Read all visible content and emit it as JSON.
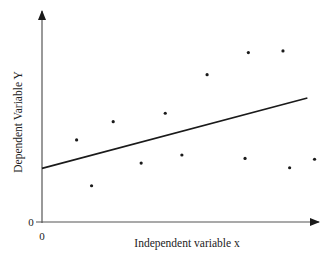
{
  "chart_data": {
    "type": "scatter",
    "title": "",
    "xlabel": "Independent variable x",
    "ylabel": "Dependent Variable Y",
    "x_tick_labels": [
      "0"
    ],
    "y_tick_labels": [
      "0"
    ],
    "xlim": [
      0,
      100
    ],
    "ylim": [
      0,
      100
    ],
    "grid": false,
    "legend": null,
    "series": [
      {
        "name": "observations",
        "kind": "points",
        "points": [
          {
            "x": 12.5,
            "y": 38.7
          },
          {
            "x": 17.9,
            "y": 17.1
          },
          {
            "x": 25.7,
            "y": 47.3
          },
          {
            "x": 35.8,
            "y": 27.8
          },
          {
            "x": 44.5,
            "y": 51.3
          },
          {
            "x": 50.5,
            "y": 31.6
          },
          {
            "x": 59.6,
            "y": 69.5
          },
          {
            "x": 73.3,
            "y": 30.0
          },
          {
            "x": 74.5,
            "y": 79.9
          },
          {
            "x": 87.0,
            "y": 80.7
          },
          {
            "x": 89.4,
            "y": 25.6
          },
          {
            "x": 98.4,
            "y": 29.6
          }
        ]
      },
      {
        "name": "regression line",
        "kind": "line",
        "points": [
          {
            "x": 0,
            "y": 25.3
          },
          {
            "x": 95.8,
            "y": 58.5
          }
        ]
      }
    ]
  },
  "axes": {
    "x_label": "Independent variable x",
    "y_label": "Dependent Variable Y",
    "x_origin_label": "0",
    "y_origin_label": "0"
  },
  "colors": {
    "ink": "#1a1a1a",
    "axis": "#555555",
    "background": "#ffffff"
  }
}
